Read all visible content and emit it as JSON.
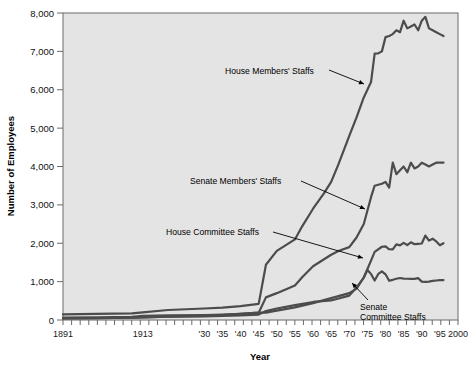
{
  "chart_data": {
    "type": "line",
    "title": "",
    "xlabel": "Year",
    "ylabel": "Number of Employees",
    "xlim": [
      1891,
      2000
    ],
    "ylim": [
      0,
      8000
    ],
    "grid": false,
    "legend_position": "inline-annotations",
    "ytick_labels": [
      "0",
      "1,000",
      "2,000",
      "3,000",
      "4,000",
      "5,000",
      "6,000",
      "7,000",
      "8,000"
    ],
    "ytick_values": [
      0,
      1000,
      2000,
      3000,
      4000,
      5000,
      6000,
      7000,
      8000
    ],
    "xtick_labels": [
      "1891",
      "1913",
      "'30",
      "'35",
      "'40",
      "'45",
      "'50",
      "'55",
      "'60",
      "'65",
      "'70",
      "'75",
      "'80",
      "'85",
      "'90",
      "'95",
      "2000"
    ],
    "xtick_values": [
      1891,
      1913,
      1930,
      1935,
      1940,
      1945,
      1950,
      1955,
      1960,
      1965,
      1970,
      1975,
      1980,
      1985,
      1990,
      1995,
      2000
    ],
    "minor_tick_interval": 2.5,
    "series": [
      {
        "name": "House Members' Staffs",
        "x": [
          1891,
          1900,
          1910,
          1913,
          1920,
          1930,
          1935,
          1940,
          1945,
          1947,
          1950,
          1955,
          1957,
          1960,
          1963,
          1965,
          1967,
          1970,
          1972,
          1974,
          1976,
          1977,
          1978,
          1979,
          1980,
          1981,
          1982,
          1983,
          1984,
          1985,
          1986,
          1987,
          1988,
          1989,
          1990,
          1991,
          1992,
          1993,
          1994,
          1995,
          1996
        ],
        "values": [
          146,
          160,
          175,
          200,
          260,
          300,
          320,
          360,
          420,
          1440,
          1800,
          2100,
          2441,
          2900,
          3300,
          3600,
          4055,
          4800,
          5280,
          5800,
          6200,
          6942,
          6950,
          7000,
          7371,
          7400,
          7450,
          7550,
          7500,
          7800,
          7600,
          7650,
          7700,
          7550,
          7800,
          7900,
          7600,
          7550,
          7500,
          7450,
          7400
        ]
      },
      {
        "name": "Senate Members' Staffs",
        "x": [
          1891,
          1900,
          1910,
          1913,
          1920,
          1930,
          1935,
          1940,
          1945,
          1947,
          1950,
          1955,
          1957,
          1960,
          1965,
          1967,
          1970,
          1972,
          1974,
          1976,
          1977,
          1979,
          1980,
          1981,
          1982,
          1983,
          1984,
          1985,
          1986,
          1987,
          1988,
          1989,
          1990,
          1991,
          1992,
          1993,
          1994,
          1995,
          1996
        ],
        "values": [
          39,
          50,
          60,
          70,
          90,
          110,
          130,
          160,
          190,
          590,
          700,
          900,
          1115,
          1400,
          1700,
          1800,
          1900,
          2150,
          2500,
          3200,
          3500,
          3550,
          3600,
          3450,
          4100,
          3800,
          3900,
          4000,
          3850,
          4100,
          3950,
          4000,
          4100,
          4050,
          4000,
          4050,
          4100,
          4100,
          4100
        ]
      },
      {
        "name": "House Committee Staffs",
        "x": [
          1891,
          1900,
          1910,
          1913,
          1920,
          1930,
          1935,
          1940,
          1945,
          1947,
          1950,
          1955,
          1960,
          1965,
          1970,
          1972,
          1974,
          1976,
          1977,
          1979,
          1980,
          1981,
          1982,
          1983,
          1984,
          1985,
          1986,
          1987,
          1988,
          1989,
          1990,
          1991,
          1992,
          1993,
          1994,
          1995,
          1996
        ],
        "values": [
          62,
          70,
          80,
          105,
          120,
          130,
          140,
          160,
          190,
          193,
          246,
          329,
          440,
          571,
          700,
          817,
          1107,
          1548,
          1776,
          1909,
          1917,
          1843,
          1839,
          1970,
          1944,
          2009,
          1954,
          2024,
          1976,
          1986,
          1993,
          2201,
          2068,
          2118,
          2046,
          1950,
          2000
        ]
      },
      {
        "name": "Senate Committee Staffs",
        "x": [
          1891,
          1900,
          1910,
          1913,
          1920,
          1930,
          1935,
          1940,
          1945,
          1947,
          1950,
          1955,
          1960,
          1965,
          1970,
          1972,
          1974,
          1975,
          1976,
          1977,
          1978,
          1979,
          1980,
          1981,
          1982,
          1983,
          1984,
          1985,
          1986,
          1987,
          1988,
          1989,
          1990,
          1991,
          1992,
          1993,
          1994,
          1995,
          1996
        ],
        "values": [
          41,
          50,
          58,
          70,
          85,
          95,
          105,
          120,
          140,
          232,
          300,
          386,
          470,
          509,
          635,
          844,
          1107,
          1300,
          1201,
          1028,
          1200,
          1269,
          1191,
          1022,
          1047,
          1075,
          1095,
          1080,
          1075,
          1074,
          1070,
          1090,
          1000,
          995,
          1000,
          1020,
          1030,
          1040,
          1040
        ]
      }
    ],
    "annotations": [
      {
        "label": "House Members' Staffs",
        "lines": [
          "House Members' Staffs"
        ]
      },
      {
        "label": "Senate Members' Staffs",
        "lines": [
          "Senate Members' Staffs"
        ]
      },
      {
        "label": "House Committee Staffs",
        "lines": [
          "House Committee Staffs"
        ]
      },
      {
        "label": "Senate Committee Staffs",
        "lines": [
          "Senate",
          "Committee Staffs"
        ]
      }
    ],
    "colors": {
      "plot_background": "#e4e4e4",
      "line_color": "#4c4c4c",
      "axis_color": "#6b6b6b",
      "text_color": "#111111",
      "page_background": "#ffffff"
    }
  },
  "axis": {
    "y_title": "Number of Employees",
    "x_title": "Year"
  },
  "ticks": {
    "y": [
      {
        "label": "8,000",
        "value": 8000
      },
      {
        "label": "7,000",
        "value": 7000
      },
      {
        "label": "6,000",
        "value": 6000
      },
      {
        "label": "5,000",
        "value": 5000
      },
      {
        "label": "4,000",
        "value": 4000
      },
      {
        "label": "3,000",
        "value": 3000
      },
      {
        "label": "2,000",
        "value": 2000
      },
      {
        "label": "1,000",
        "value": 1000
      },
      {
        "label": "0",
        "value": 0
      }
    ],
    "x": [
      {
        "label": "1891",
        "value": 1891
      },
      {
        "label": "1913",
        "value": 1913
      },
      {
        "label": "'30",
        "value": 1930
      },
      {
        "label": "'35",
        "value": 1935
      },
      {
        "label": "'40",
        "value": 1940
      },
      {
        "label": "'45",
        "value": 1945
      },
      {
        "label": "'50",
        "value": 1950
      },
      {
        "label": "'55",
        "value": 1955
      },
      {
        "label": "'60",
        "value": 1960
      },
      {
        "label": "'65",
        "value": 1965
      },
      {
        "label": "'70",
        "value": 1970
      },
      {
        "label": "'75",
        "value": 1975
      },
      {
        "label": "'80",
        "value": 1980
      },
      {
        "label": "'85",
        "value": 1985
      },
      {
        "label": "'90",
        "value": 1990
      },
      {
        "label": "'95",
        "value": 1995
      },
      {
        "label": "2000",
        "value": 2000
      }
    ]
  },
  "annotation_text": {
    "house_members": "House Members' Staffs",
    "senate_members": "Senate Members' Staffs",
    "house_committee": "House Committee Staffs",
    "senate_committee_l1": "Senate",
    "senate_committee_l2": "Committee Staffs"
  }
}
